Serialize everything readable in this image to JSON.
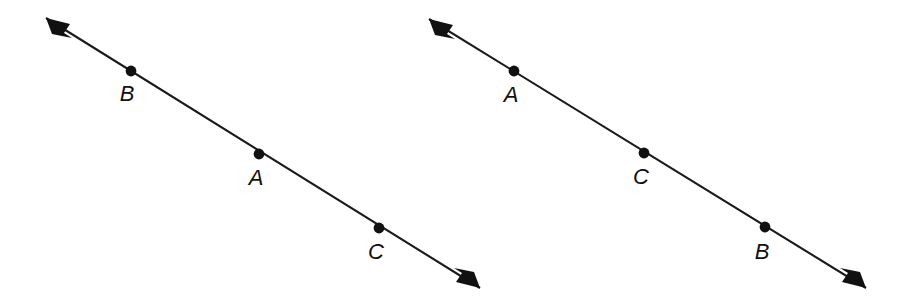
{
  "figure": {
    "background_color": "#ffffff",
    "ink_color": "#111111",
    "line_color": "#1a1a1a",
    "line_width_px": 2.1,
    "dot_radius_px": 5.4,
    "label_font_size_px": 22,
    "label_style": "italic",
    "lines": [
      {
        "id": "left-line",
        "name": "left-number-line",
        "arrowheads": "both",
        "start": {
          "x": 46,
          "y": 18
        },
        "end": {
          "x": 480,
          "y": 288
        },
        "slope": 0.622,
        "points": [
          {
            "label": "B",
            "order": 1,
            "dot": {
              "x": 131,
              "y": 71
            },
            "label_pos": {
              "x": 127,
              "y": 101
            }
          },
          {
            "label": "A",
            "order": 2,
            "dot": {
              "x": 259,
              "y": 154
            },
            "label_pos": {
              "x": 256,
              "y": 185
            }
          },
          {
            "label": "C",
            "order": 3,
            "dot": {
              "x": 379,
              "y": 228
            },
            "label_pos": {
              "x": 376,
              "y": 259
            }
          }
        ]
      },
      {
        "id": "right-line",
        "name": "right-number-line",
        "arrowheads": "both",
        "start": {
          "x": 429,
          "y": 19
        },
        "end": {
          "x": 866,
          "y": 288
        },
        "slope": 0.615,
        "points": [
          {
            "label": "A",
            "order": 1,
            "dot": {
              "x": 514,
              "y": 71
            },
            "label_pos": {
              "x": 511,
              "y": 102
            }
          },
          {
            "label": "C",
            "order": 2,
            "dot": {
              "x": 644,
              "y": 153
            },
            "label_pos": {
              "x": 641,
              "y": 184
            }
          },
          {
            "label": "B",
            "order": 3,
            "dot": {
              "x": 765,
              "y": 227
            },
            "label_pos": {
              "x": 762,
              "y": 259
            }
          }
        ]
      }
    ]
  }
}
